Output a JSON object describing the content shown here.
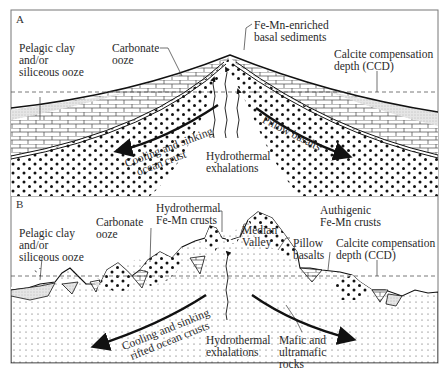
{
  "figure": {
    "panels": [
      {
        "id": "A",
        "letter": "A",
        "labels": {
          "pelagic": [
            "Pelagic clay",
            "and/or",
            "siliceous ooze"
          ],
          "carbonate": [
            "Carbonate",
            "ooze"
          ],
          "femn_basal": [
            "Fe-Mn-enriched",
            "basal sediments"
          ],
          "ccd": [
            "Calcite compensation",
            "depth (CCD)"
          ],
          "cooling": [
            "Cooling and sinking",
            "ocean crust"
          ],
          "hydrothermal": [
            "Hydrothermal",
            "exhalations"
          ],
          "pillow": "Pillow basalts"
        }
      },
      {
        "id": "B",
        "letter": "B",
        "labels": {
          "pelagic": [
            "Pelagic clay",
            "and/or",
            "siliceous ooze"
          ],
          "carbonate": [
            "Carbonate",
            "ooze"
          ],
          "hydro_crusts": [
            "Hydrothermal",
            "Fe-Mn crusts"
          ],
          "median": [
            "Median",
            "Valley"
          ],
          "pillow": [
            "Pillow",
            "basalts"
          ],
          "authigenic": [
            "Authigenic",
            "Fe-Mn crusts"
          ],
          "ccd": [
            "Calcite compensation",
            "depth (CCD)"
          ],
          "cooling": [
            "Cooling and sinking",
            "rifted ocean crusts"
          ],
          "hydrothermal": [
            "Hydrothermal",
            "exhalations"
          ],
          "mafic": [
            "Mafic and",
            "ultramafic",
            "rocks"
          ]
        }
      }
    ],
    "colors": {
      "ink": "#222222",
      "frame": "#777777",
      "background": "#ffffff",
      "stipple": "#cfcfcf"
    }
  }
}
